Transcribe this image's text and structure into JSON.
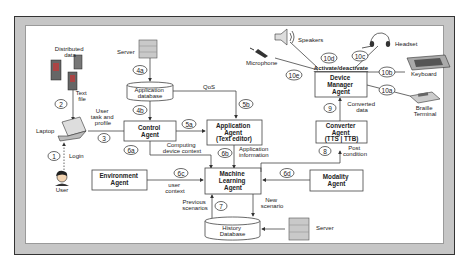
{
  "diagram": {
    "devices": {
      "distributed_data": [
        "Distributed",
        "data"
      ],
      "text_file": [
        "Text",
        "file"
      ],
      "laptop": "Laptop",
      "user": "User",
      "server_top": "Server",
      "server_bottom": "Server",
      "speakers": "Speakers",
      "microphone": "Microphone",
      "headset": "Headset",
      "keyboard": "Keyboard",
      "braille": [
        "Braille",
        "Terminal"
      ]
    },
    "boxes": {
      "application_database": [
        "Application",
        "database"
      ],
      "control_agent": [
        "Control",
        "Agent"
      ],
      "application_agent": [
        "Application",
        "Agent",
        "(Text editor)"
      ],
      "environment_agent": [
        "Environment",
        "Agent"
      ],
      "machine_learning_agent": [
        "Machine",
        "Learning",
        "Agent"
      ],
      "history_database": [
        "History",
        "Database"
      ],
      "device_manager_agent": [
        "Device",
        "Manager",
        "Agent"
      ],
      "converter_agent": [
        "Converter",
        "Agent",
        "(TTS | TTB)"
      ],
      "modality_agent": [
        "Modality",
        "Agent"
      ]
    },
    "edge_labels": {
      "login": "Login",
      "user_task_profile": [
        "User",
        "task and",
        "profile"
      ],
      "qos": "QoS",
      "computing_device_context": [
        "Computing",
        "device context"
      ],
      "application_information": [
        "Application",
        "information"
      ],
      "user_context": [
        "user",
        "context"
      ],
      "previous_scenarios": [
        "Previous",
        "scenarios"
      ],
      "new_scenario": [
        "New",
        "scenario"
      ],
      "converted_data": [
        "Converted",
        "data"
      ],
      "post_condition": [
        "Post",
        "condition"
      ],
      "activate_deactivate": "Activate/deactivate"
    },
    "step_numbers": {
      "s1": "1",
      "s2": "2",
      "s3": "3",
      "s4a": "4a",
      "s4b": "4b",
      "s5a": "5a",
      "s5b": "5b",
      "s6a": "6a",
      "s6b": "6b",
      "s6c": "6c",
      "s6d": "6d",
      "s7": "7",
      "s8": "8",
      "s9": "9",
      "s10a": "10a",
      "s10b": "10b",
      "s10c": "10c",
      "s10d": "10d",
      "s10e": "10e"
    }
  }
}
